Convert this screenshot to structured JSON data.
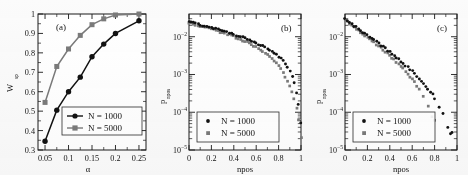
{
  "figure": {
    "panel_count": 3,
    "series_colors": {
      "n1000": "#121212",
      "n5000": "#7a7a7a"
    },
    "axis_color": "#1a1a1a",
    "background": "#fbfbfb"
  },
  "legend": {
    "n1000_label": "N = 1000",
    "n5000_label": "N = 5000"
  },
  "chart_data": [
    {
      "type": "line",
      "panel": "(a)",
      "title": "",
      "xlabel": "α",
      "ylabel": "W",
      "ylabel_sub": "sp",
      "xlim": [
        0.035,
        0.265
      ],
      "ylim": [
        0.3,
        1.0
      ],
      "xscale": "linear",
      "yscale": "linear",
      "grid": false,
      "xticks": [
        0.05,
        0.1,
        0.15,
        0.2,
        0.25
      ],
      "xtick_labels": [
        "0.05",
        "0.1",
        "0.15",
        "0.2",
        "0.25"
      ],
      "yticks": [
        0.3,
        0.4,
        0.5,
        0.6,
        0.7,
        0.8,
        0.9,
        1.0
      ],
      "ytick_labels": [
        "0.3",
        "0.4",
        "0.5",
        "0.6",
        "0.7",
        "0.8",
        "0.9",
        "1"
      ],
      "legend_position": "lower right",
      "series": [
        {
          "name": "N = 1000",
          "marker": "circle",
          "color": "#121212",
          "x": [
            0.05,
            0.075,
            0.1,
            0.125,
            0.15,
            0.175,
            0.2,
            0.25
          ],
          "values": [
            0.345,
            0.505,
            0.6,
            0.675,
            0.78,
            0.845,
            0.9,
            0.965
          ]
        },
        {
          "name": "N = 5000",
          "marker": "square",
          "color": "#7a7a7a",
          "x": [
            0.05,
            0.075,
            0.1,
            0.125,
            0.15,
            0.175,
            0.2,
            0.25
          ],
          "values": [
            0.545,
            0.73,
            0.82,
            0.89,
            0.945,
            0.975,
            0.995,
            1.0
          ]
        }
      ]
    },
    {
      "type": "scatter",
      "panel": "(b)",
      "title": "",
      "xlabel": "npos",
      "ylabel": "p",
      "ylabel_sub": "npos",
      "xlim": [
        0,
        1
      ],
      "ylim": [
        1e-05,
        0.04
      ],
      "xscale": "linear",
      "yscale": "log",
      "grid": false,
      "xticks": [
        0,
        0.2,
        0.4,
        0.6,
        0.8,
        1
      ],
      "xtick_labels": [
        "0",
        "0.2",
        "0.4",
        "0.6",
        "0.8",
        "1"
      ],
      "yticks": [
        0.01,
        0.001,
        0.0001,
        1e-05
      ],
      "ytick_labels": [
        "10-2",
        "10-3",
        "10-4",
        "10-5"
      ],
      "legend_position": "lower left",
      "series": [
        {
          "name": "N = 1000",
          "marker": "circle",
          "color": "#121212",
          "x": [
            0.0,
            0.02,
            0.04,
            0.06,
            0.08,
            0.1,
            0.12,
            0.14,
            0.16,
            0.18,
            0.2,
            0.22,
            0.24,
            0.26,
            0.28,
            0.3,
            0.32,
            0.34,
            0.36,
            0.38,
            0.4,
            0.42,
            0.44,
            0.46,
            0.48,
            0.5,
            0.52,
            0.54,
            0.56,
            0.58,
            0.6,
            0.62,
            0.64,
            0.66,
            0.68,
            0.7,
            0.72,
            0.74,
            0.76,
            0.78,
            0.8,
            0.82,
            0.84,
            0.86,
            0.88,
            0.9,
            0.92,
            0.94,
            0.96,
            0.98,
            1.0
          ],
          "values": [
            0.025,
            0.024,
            0.0232,
            0.0224,
            0.0216,
            0.0208,
            0.02,
            0.0193,
            0.0186,
            0.018,
            0.0173,
            0.0167,
            0.0161,
            0.0155,
            0.0149,
            0.0143,
            0.0137,
            0.0131,
            0.0126,
            0.012,
            0.0115,
            0.011,
            0.0105,
            0.01,
            0.0095,
            0.009,
            0.00855,
            0.0081,
            0.00765,
            0.0072,
            0.00678,
            0.00635,
            0.00595,
            0.00556,
            0.00518,
            0.0048,
            0.00442,
            0.00405,
            0.00368,
            0.00332,
            0.00296,
            0.0026,
            0.00224,
            0.00188,
            0.00152,
            0.00118,
            0.00086,
            0.00058,
            0.00034,
            0.00016,
            5.5e-05
          ]
        },
        {
          "name": "N = 5000",
          "marker": "square",
          "color": "#7a7a7a",
          "x": [
            0.0,
            0.02,
            0.04,
            0.06,
            0.08,
            0.1,
            0.12,
            0.14,
            0.16,
            0.18,
            0.2,
            0.22,
            0.24,
            0.26,
            0.28,
            0.3,
            0.32,
            0.34,
            0.36,
            0.38,
            0.4,
            0.42,
            0.44,
            0.46,
            0.48,
            0.5,
            0.52,
            0.54,
            0.56,
            0.58,
            0.6,
            0.62,
            0.64,
            0.66,
            0.68,
            0.7,
            0.72,
            0.74,
            0.76,
            0.78,
            0.8,
            0.82,
            0.84,
            0.86,
            0.88,
            0.9,
            0.92,
            0.94,
            0.96,
            0.98,
            1.0
          ],
          "values": [
            0.0235,
            0.0226,
            0.0218,
            0.021,
            0.0202,
            0.0195,
            0.0187,
            0.018,
            0.0173,
            0.0166,
            0.016,
            0.0153,
            0.0147,
            0.0141,
            0.0135,
            0.0129,
            0.0123,
            0.0117,
            0.0112,
            0.0106,
            0.0101,
            0.00955,
            0.00905,
            0.00855,
            0.00805,
            0.00756,
            0.0071,
            0.00665,
            0.0062,
            0.00576,
            0.00533,
            0.00491,
            0.0045,
            0.0041,
            0.00371,
            0.00333,
            0.00296,
            0.00261,
            0.00227,
            0.00195,
            0.00165,
            0.00137,
            0.00111,
            0.00088,
            0.00067,
            0.00049,
            0.00034,
            0.00022,
            0.00013,
            6.5e-05,
            2.2e-05
          ]
        }
      ]
    },
    {
      "type": "scatter",
      "panel": "(c)",
      "title": "",
      "xlabel": "npos",
      "ylabel": "p",
      "ylabel_sub": "npos",
      "xlim": [
        0,
        1
      ],
      "ylim": [
        1e-05,
        0.04
      ],
      "xscale": "linear",
      "yscale": "log",
      "grid": false,
      "xticks": [
        0,
        0.2,
        0.4,
        0.6,
        0.8,
        1
      ],
      "xtick_labels": [
        "0",
        "0.2",
        "0.4",
        "0.6",
        "0.8",
        "1"
      ],
      "yticks": [
        0.01,
        0.001,
        0.0001,
        1e-05
      ],
      "ytick_labels": [
        "10-2",
        "10-3",
        "10-4",
        "10-5"
      ],
      "legend_position": "lower left",
      "series": [
        {
          "name": "N = 1000",
          "marker": "circle",
          "color": "#121212",
          "x": [
            0.0,
            0.02,
            0.04,
            0.06,
            0.08,
            0.1,
            0.12,
            0.14,
            0.16,
            0.18,
            0.2,
            0.22,
            0.24,
            0.26,
            0.28,
            0.3,
            0.32,
            0.34,
            0.36,
            0.38,
            0.4,
            0.42,
            0.44,
            0.46,
            0.48,
            0.5,
            0.52,
            0.54,
            0.56,
            0.58,
            0.6,
            0.62,
            0.64,
            0.66,
            0.68,
            0.7,
            0.72,
            0.74,
            0.76,
            0.78,
            0.8,
            0.84,
            0.88,
            0.92,
            0.94,
            0.96
          ],
          "values": [
            0.029,
            0.0262,
            0.0238,
            0.0216,
            0.0196,
            0.0178,
            0.0162,
            0.0147,
            0.0133,
            0.0121,
            0.011,
            0.00995,
            0.009,
            0.00815,
            0.00737,
            0.00665,
            0.006,
            0.00541,
            0.00487,
            0.00438,
            0.00393,
            0.00352,
            0.00315,
            0.00281,
            0.00251,
            0.00223,
            0.00198,
            0.00175,
            0.00155,
            0.00136,
            0.0012,
            0.00105,
            0.00091,
            0.00079,
            0.00068,
            0.00058,
            0.0005,
            0.00042,
            0.00035,
            0.00029,
            0.00023,
            0.00014,
            9e-05,
            4e-05,
            2.8e-05,
            2.8e-05
          ]
        },
        {
          "name": "N = 5000",
          "marker": "square",
          "color": "#7a7a7a",
          "x": [
            0.0,
            0.02,
            0.04,
            0.06,
            0.08,
            0.1,
            0.12,
            0.14,
            0.16,
            0.18,
            0.2,
            0.22,
            0.24,
            0.26,
            0.28,
            0.3,
            0.32,
            0.34,
            0.36,
            0.38,
            0.4,
            0.42,
            0.44,
            0.46,
            0.48,
            0.5,
            0.52,
            0.54,
            0.56,
            0.58,
            0.6,
            0.62,
            0.64,
            0.66,
            0.7,
            0.74,
            0.78,
            0.8
          ],
          "values": [
            0.0275,
            0.0248,
            0.0224,
            0.0202,
            0.0182,
            0.0164,
            0.0148,
            0.0133,
            0.012,
            0.0108,
            0.0097,
            0.00872,
            0.00783,
            0.00703,
            0.0063,
            0.00564,
            0.00504,
            0.0045,
            0.00401,
            0.00356,
            0.00316,
            0.00279,
            0.00246,
            0.00216,
            0.00189,
            0.00165,
            0.00143,
            0.00123,
            0.00105,
            0.00089,
            0.00075,
            0.00062,
            0.00051,
            0.00041,
            0.00026,
            0.00015,
            8e-05,
            6e-05
          ]
        }
      ]
    }
  ]
}
